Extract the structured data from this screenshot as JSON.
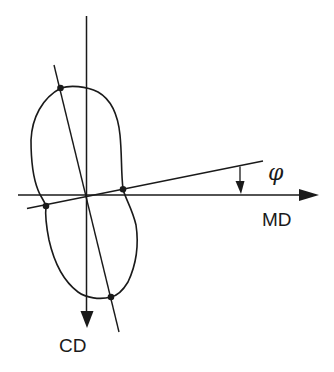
{
  "diagram": {
    "type": "polar orientation diagram (lobed distribution)",
    "labels": {
      "md": "MD",
      "cd": "CD",
      "angle": "φ"
    },
    "colors": {
      "stroke": "#1a1a1a",
      "background": "#ffffff"
    },
    "axes": [
      {
        "name": "MD",
        "direction": "horizontal, arrow to the right"
      },
      {
        "name": "CD",
        "direction": "vertical, arrow downward"
      }
    ],
    "lines": [
      {
        "name": "principal-axis",
        "description": "tilted line through origin passing through top and bottom lobe points"
      },
      {
        "name": "angle-reference-line",
        "description": "line rising to the right from origin, angle φ with MD axis"
      }
    ],
    "marked_points": 4
  }
}
